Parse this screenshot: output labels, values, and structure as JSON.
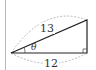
{
  "diagram": {
    "type": "right-triangle",
    "labels": {
      "hypotenuse": "13",
      "base": "12",
      "angle": "θ"
    },
    "right_angle_marker": true,
    "colors": {
      "stroke": "#222222",
      "dashed": "#aaaaaa",
      "border": "#b8b8b8"
    }
  }
}
